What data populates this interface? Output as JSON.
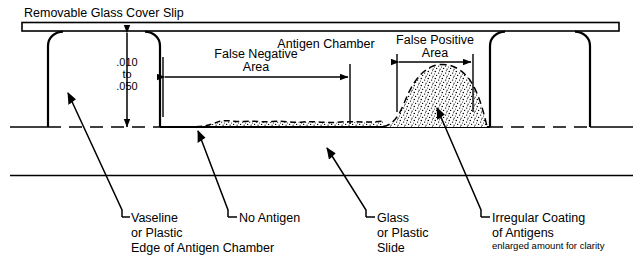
{
  "figure": {
    "type": "technical-cross-section-diagram",
    "background_color": "#ffffff",
    "line_color": "#000000"
  },
  "top_label": {
    "text": "Removable Glass Cover Slip"
  },
  "dimension_callout": {
    "line1": ".010",
    "line2": "to",
    "line3": ".050"
  },
  "regions": {
    "antigen_chamber": {
      "label": "Antigen Chamber"
    },
    "false_negative": {
      "line1": "False Negative",
      "line2": "Area"
    },
    "false_positive": {
      "line1": "False Positive",
      "line2": "Area"
    }
  },
  "callouts": [
    {
      "name": "vaseline-edge",
      "line1": "Vaseline",
      "line2": "or Plastic",
      "line3": "Edge of Antigen Chamber",
      "note": ""
    },
    {
      "name": "no-antigen",
      "line1": "No Antigen",
      "line2": "",
      "line3": "",
      "note": ""
    },
    {
      "name": "glass-or-plastic-slide",
      "line1": "Glass",
      "line2": "or Plastic",
      "line3": "Slide",
      "note": ""
    },
    {
      "name": "irregular-coating",
      "line1": "Irregular Coating",
      "line2": "of Antigens",
      "line3": "",
      "note": "enlarged amount for clarity"
    }
  ]
}
